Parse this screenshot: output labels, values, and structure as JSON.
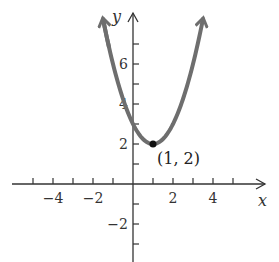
{
  "chart_data": {
    "type": "line",
    "title": "",
    "function": "y = (x - 1)^2 + 2",
    "xlabel": "x",
    "ylabel": "y",
    "xlim": [
      -6.5,
      6.5
    ],
    "ylim": [
      -3.9,
      8.5
    ],
    "x_ticks": [
      -5,
      -4,
      -3,
      -2,
      -1,
      1,
      2,
      3,
      4,
      5
    ],
    "x_tick_labels": [
      {
        "value": -4,
        "label": "−4"
      },
      {
        "value": -2,
        "label": "−2"
      },
      {
        "value": 2,
        "label": "2"
      },
      {
        "value": 4,
        "label": "4"
      }
    ],
    "y_ticks": [
      -3,
      -2,
      -1,
      1,
      2,
      3,
      4,
      5,
      6,
      7
    ],
    "y_tick_labels": [
      {
        "value": -2,
        "label": "−2"
      },
      {
        "value": 2,
        "label": "2"
      },
      {
        "value": 4,
        "label": "4"
      },
      {
        "value": 6,
        "label": "6"
      }
    ],
    "series": [
      {
        "name": "parabola",
        "x": [
          -1.5,
          -1,
          -0.5,
          0,
          0.5,
          1,
          1.5,
          2,
          2.5,
          3,
          3.5
        ],
        "y": [
          8.25,
          6,
          4.25,
          3,
          2.25,
          2,
          2.25,
          3,
          4.25,
          6,
          8.25
        ],
        "arrows_at_ends": true,
        "color": "#6e6e6e"
      }
    ],
    "annotations": [
      {
        "x": 1,
        "y": 2,
        "label": "(1, 2)",
        "marker": "dot"
      }
    ],
    "grid": false,
    "legend": null
  }
}
